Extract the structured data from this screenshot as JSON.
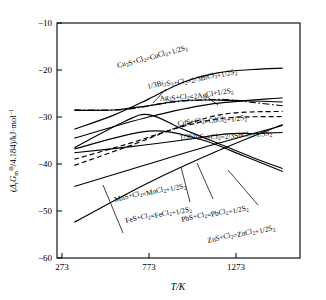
{
  "chart_data": {
    "type": "line",
    "title": "",
    "xlabel": "T/K",
    "ylabel": "(ΔrGₘ⊖/4.184)/kJ·mol⁻¹",
    "xlim": [
      173,
      1573
    ],
    "ylim": [
      -60,
      -10
    ],
    "xticks": [
      273,
      773,
      1273
    ],
    "xticklabels": [
      "273",
      "773",
      "1273"
    ],
    "yticks": [
      -10,
      -20,
      -30,
      -40,
      -50,
      -60
    ],
    "yticklabels": [
      "−10",
      "−20",
      "−30",
      "−40",
      "−50",
      "−60"
    ],
    "grid": false,
    "legend_position": "inline-labels",
    "series": [
      {
        "name": "Cu2S",
        "label": "Cu₂S+Cl₂=CuCl₂+1/2S₂",
        "style": "solid",
        "x": [
          273,
          500,
          700,
          900,
          1100,
          1300,
          1473
        ],
        "y": [
          -32.6,
          -29.6,
          -26.2,
          -22.6,
          -20.6,
          -19.9,
          -19.6
        ]
      },
      {
        "name": "Bi2S3",
        "label": "1/3Bi₂S₃+Cl₂=2/3BiCl₃+1/2S₂",
        "style": "dashdot",
        "x": [
          273,
          560,
          800,
          1000,
          1150,
          1300,
          1473
        ],
        "y": [
          -28.5,
          -28.4,
          -27.0,
          -26.4,
          -26.3,
          -26.9,
          -27.6
        ]
      },
      {
        "name": "Ag2S",
        "label": "Ag₂S+Cl₂=2AgCl+1/2S₂",
        "style": "solid",
        "x": [
          273,
          500,
          700,
          900,
          1100,
          1300,
          1473
        ],
        "y": [
          -28.6,
          -28.5,
          -27.6,
          -26.5,
          -26.4,
          -26.6,
          -26.8
        ]
      },
      {
        "name": "CdS",
        "label": "CdS+Cl₂=CdCl₂+1/2S₂",
        "style": "dashed",
        "x": [
          273,
          600,
          900,
          1150,
          1473
        ],
        "y": [
          -40.3,
          -36.0,
          -31.8,
          -29.3,
          -28.8
        ]
      },
      {
        "name": "Sb2S3",
        "label": "1/3Sb₂S₃+Cl₂=2/3SbCl₃+1/3S₂",
        "style": "dashed",
        "x": [
          273,
          600,
          900,
          1150,
          1473
        ],
        "y": [
          -39.0,
          -35.5,
          -32.0,
          -30.2,
          -29.9
        ]
      },
      {
        "name": "MnS",
        "label": "MnS+Cl₂=MnCl₂+1/2S₂",
        "style": "solid",
        "x": [
          273,
          600,
          900,
          1150,
          1300,
          1473
        ],
        "y": [
          -37.6,
          -36.3,
          -34.9,
          -33.6,
          -33.5,
          -33.3
        ]
      },
      {
        "name": "FeS",
        "label": "FeS+Cl₂=FeCl₂+1/2S₂",
        "style": "solid",
        "x": [
          273,
          700,
          1100,
          1473
        ],
        "y": [
          -52.4,
          -44.0,
          -37.2,
          -31.6
        ]
      },
      {
        "name": "PbS",
        "label": "PbS+Cl₂=PbCl₂+1/2S₂",
        "style": "solid",
        "x": [
          273,
          700,
          1100,
          1473
        ],
        "y": [
          -44.8,
          -40.0,
          -35.6,
          -31.8
        ]
      },
      {
        "name": "ZnS",
        "label": "ZnS+Cl₂=ZnCl₂+1/2S₂",
        "style": "solid",
        "x": [
          273,
          700,
          1000,
          1250,
          1473
        ],
        "y": [
          -36.8,
          -33.0,
          -34.8,
          -38.3,
          -41.6
        ]
      },
      {
        "name": "upper-rising",
        "label": "",
        "style": "solid",
        "x": [
          273,
          700,
          1050,
          1473
        ],
        "y": [
          -34.5,
          -30.0,
          -27.3,
          -25.9
        ]
      },
      {
        "name": "peaked",
        "label": "",
        "style": "solid",
        "x": [
          273,
          560,
          700,
          900,
          1100,
          1300,
          1473
        ],
        "y": [
          -36.5,
          -31.0,
          -29.5,
          -32.6,
          -35.6,
          -38.6,
          -41.0
        ]
      }
    ]
  },
  "axes": {
    "x_title": "T/K",
    "y_title_parts": {
      "open": "(",
      "delta": "Δ",
      "sub_r": "r",
      "G": "G",
      "sub_m": "m",
      "standard": "⊖",
      "divider": "/4.184)/kJ·mol",
      "sup": "−1"
    }
  }
}
